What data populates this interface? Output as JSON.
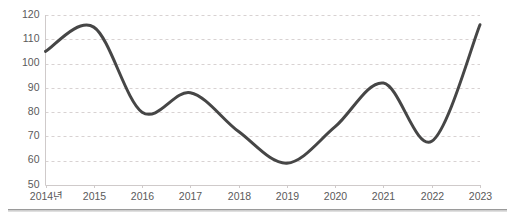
{
  "chart_data": {
    "type": "line",
    "title": "",
    "subtitle": "",
    "xlabel": "",
    "ylabel": "",
    "categories": [
      "2014년",
      "2015",
      "2016",
      "2017",
      "2018",
      "2019",
      "2020",
      "2021",
      "2022",
      "2023"
    ],
    "values": [
      105,
      115,
      80,
      88,
      72,
      59,
      74,
      92,
      68,
      116
    ],
    "series": [
      {
        "name": "series-1",
        "values": [
          105,
          115,
          80,
          88,
          72,
          59,
          74,
          92,
          68,
          116
        ],
        "color": "#464646"
      }
    ],
    "ylim": [
      50,
      120
    ],
    "yticks": [
      50,
      60,
      70,
      80,
      90,
      100,
      110,
      120
    ],
    "ytick_labels": [
      "50",
      "60",
      "70",
      "80",
      "90",
      "100",
      "110",
      "120"
    ],
    "xtick_labels": [
      "2014년",
      "2015",
      "2016",
      "2017",
      "2018",
      "2019",
      "2020",
      "2021",
      "2022",
      "2023"
    ],
    "grid": true,
    "grid_style": "dashed-horizontal",
    "legend": false,
    "legend_position": "none",
    "line_style": "smooth",
    "markers": false,
    "annotations": []
  },
  "colors": {
    "line": "#464646",
    "gridline": "#d8d2d2",
    "axis": "#cfcaca",
    "tick_text": "#5a5a5a",
    "background": "#ffffff",
    "divider": "#9a9a9a"
  },
  "axis": {
    "y_labels": [
      "120",
      "110",
      "100",
      "90",
      "80",
      "70",
      "60",
      "50"
    ],
    "x_labels": [
      "2014년",
      "2015",
      "2016",
      "2017",
      "2018",
      "2019",
      "2020",
      "2021",
      "2022",
      "2023"
    ]
  },
  "divider": {
    "name": "bottom-rule"
  }
}
